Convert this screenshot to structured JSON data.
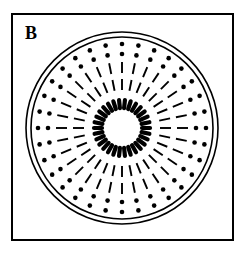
{
  "figure": {
    "panel_label": "B",
    "label_position": {
      "x": 25,
      "y": 39
    },
    "label_font_size": 18,
    "colors": {
      "stroke": "#000000",
      "fill": "#000000",
      "background": "#ffffff"
    },
    "frame": {
      "x": 12,
      "y": 14,
      "width": 221,
      "height": 226,
      "stroke_width": 2
    },
    "center": {
      "cx": 122,
      "cy": 128
    },
    "outer_circles": [
      {
        "name": "outer-circle-1",
        "r": 96,
        "stroke_width": 1.6
      },
      {
        "name": "outer-circle-2",
        "r": 91,
        "stroke_width": 1.6
      }
    ],
    "rings": [
      {
        "name": "inner-dash-ring",
        "type": "dash",
        "count": 30,
        "r_inner": 20,
        "r_outer": 28,
        "thickness": 4.2,
        "angle_offset": 6,
        "linecap": "round"
      },
      {
        "name": "mid-dash-ring-inner",
        "type": "dash",
        "count": 32,
        "r_inner": 38,
        "r_outer": 49,
        "thickness": 1.9,
        "angle_offset": 0,
        "linecap": "butt"
      },
      {
        "name": "mid-dash-ring-outer",
        "type": "dash",
        "count": 32,
        "r_inner": 55,
        "r_outer": 66,
        "thickness": 1.9,
        "angle_offset": 0,
        "linecap": "butt"
      },
      {
        "name": "dot-ring-inner",
        "type": "dot",
        "count": 32,
        "r": 74,
        "radius": 2.3,
        "angle_offset": 0
      },
      {
        "name": "dot-ring-outer",
        "type": "dot",
        "count": 32,
        "r": 84,
        "radius": 2.3,
        "angle_offset": 0
      }
    ]
  },
  "chart_data": {
    "type": "scatter",
    "title": "B",
    "xlabel": "",
    "ylabel": "",
    "coordinate_system": "polar",
    "center": {
      "x": 122,
      "y": 128
    },
    "series": [
      {
        "name": "inner-dash-ring",
        "element": "radial-dash",
        "count": 30,
        "radius_inner": 20,
        "radius_outer": 28,
        "stroke_thickness": 4.2,
        "angles_deg": [
          6,
          18,
          30,
          42,
          54,
          66,
          78,
          90,
          102,
          114,
          126,
          138,
          150,
          162,
          174,
          186,
          198,
          210,
          222,
          234,
          246,
          258,
          270,
          282,
          294,
          306,
          318,
          330,
          342,
          354
        ]
      },
      {
        "name": "mid-dash-ring-inner",
        "element": "radial-dash",
        "count": 32,
        "radius_inner": 38,
        "radius_outer": 49,
        "stroke_thickness": 1.9,
        "angles_deg": [
          0,
          11.25,
          22.5,
          33.75,
          45,
          56.25,
          67.5,
          78.75,
          90,
          101.25,
          112.5,
          123.75,
          135,
          146.25,
          157.5,
          168.75,
          180,
          191.25,
          202.5,
          213.75,
          225,
          236.25,
          247.5,
          258.75,
          270,
          281.25,
          292.5,
          303.75,
          315,
          326.25,
          337.5,
          348.75
        ]
      },
      {
        "name": "mid-dash-ring-outer",
        "element": "radial-dash",
        "count": 32,
        "radius_inner": 55,
        "radius_outer": 66,
        "stroke_thickness": 1.9,
        "angles_deg": [
          0,
          11.25,
          22.5,
          33.75,
          45,
          56.25,
          67.5,
          78.75,
          90,
          101.25,
          112.5,
          123.75,
          135,
          146.25,
          157.5,
          168.75,
          180,
          191.25,
          202.5,
          213.75,
          225,
          236.25,
          247.5,
          258.75,
          270,
          281.25,
          292.5,
          303.75,
          315,
          326.25,
          337.5,
          348.75
        ]
      },
      {
        "name": "dot-ring-inner",
        "element": "dot",
        "count": 32,
        "radius": 74,
        "dot_radius": 2.3,
        "angles_deg": [
          0,
          11.25,
          22.5,
          33.75,
          45,
          56.25,
          67.5,
          78.75,
          90,
          101.25,
          112.5,
          123.75,
          135,
          146.25,
          157.5,
          168.75,
          180,
          191.25,
          202.5,
          213.75,
          225,
          236.25,
          247.5,
          258.75,
          270,
          281.25,
          292.5,
          303.75,
          315,
          326.25,
          337.5,
          348.75
        ]
      },
      {
        "name": "dot-ring-outer",
        "element": "dot",
        "count": 32,
        "radius": 84,
        "dot_radius": 2.3,
        "angles_deg": [
          0,
          11.25,
          22.5,
          33.75,
          45,
          56.25,
          67.5,
          78.75,
          90,
          101.25,
          112.5,
          123.75,
          135,
          146.25,
          157.5,
          168.75,
          180,
          191.25,
          202.5,
          213.75,
          225,
          236.25,
          247.5,
          258.75,
          270,
          281.25,
          292.5,
          303.75,
          315,
          326.25,
          337.5,
          348.75
        ]
      }
    ],
    "boundaries": [
      {
        "name": "outer-circle-1",
        "shape": "circle",
        "radius": 96
      },
      {
        "name": "outer-circle-2",
        "shape": "circle",
        "radius": 91
      },
      {
        "name": "frame",
        "shape": "rect",
        "x": 12,
        "y": 14,
        "width": 221,
        "height": 226
      }
    ],
    "grid": false,
    "legend": false
  }
}
